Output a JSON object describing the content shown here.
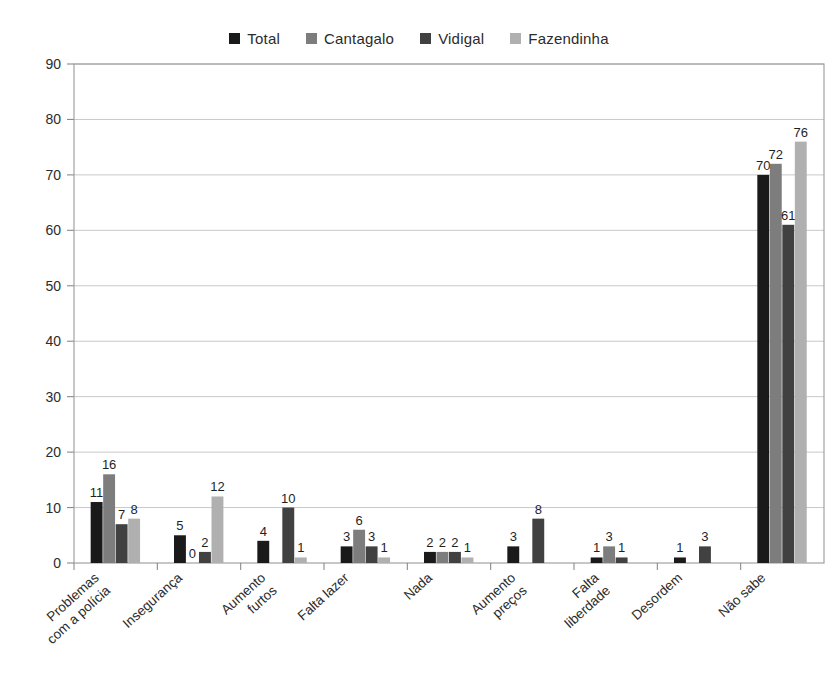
{
  "legend": {
    "position": "top-center",
    "items": [
      {
        "label": "Total",
        "color": "#1a1a1a"
      },
      {
        "label": "Cantagalo",
        "color": "#7d7d7d"
      },
      {
        "label": "Vidigal",
        "color": "#414141"
      },
      {
        "label": "Fazendinha",
        "color": "#b0b0b0"
      }
    ]
  },
  "chart_data": {
    "type": "bar",
    "title": "",
    "subtitle": "",
    "xlabel": "",
    "ylabel": "",
    "ylim": [
      0,
      90
    ],
    "ytick_step": 10,
    "yticks": [
      0,
      10,
      20,
      30,
      40,
      50,
      60,
      70,
      80,
      90
    ],
    "grid": true,
    "grid_axis": "y",
    "legend_position": "top-center",
    "data_labels": true,
    "categories": [
      "Problemas com a polícia",
      "Insegurança",
      "Aumento furtos",
      "Falta lazer",
      "Nada",
      "Aumento preços",
      "Falta liberdade",
      "Desordem",
      "Não sabe"
    ],
    "category_lines": [
      [
        "Problemas",
        "com a polícia"
      ],
      [
        "Insegurança"
      ],
      [
        "Aumento",
        "furtos"
      ],
      [
        "Falta lazer"
      ],
      [
        "Nada"
      ],
      [
        "Aumento",
        "preços"
      ],
      [
        "Falta",
        "liberdade"
      ],
      [
        "Desordem"
      ],
      [
        "Não sabe"
      ]
    ],
    "series": [
      {
        "name": "Total",
        "color": "#1a1a1a",
        "values": [
          11,
          5,
          4,
          3,
          2,
          3,
          1,
          1,
          70
        ]
      },
      {
        "name": "Cantagalo",
        "color": "#7d7d7d",
        "values": [
          16,
          0,
          0,
          6,
          2,
          0,
          3,
          0,
          72
        ]
      },
      {
        "name": "Vidigal",
        "color": "#414141",
        "values": [
          7,
          2,
          10,
          3,
          2,
          8,
          1,
          3,
          61
        ]
      },
      {
        "name": "Fazendinha",
        "color": "#b0b0b0",
        "values": [
          8,
          12,
          1,
          1,
          1,
          0,
          0,
          0,
          76
        ]
      }
    ],
    "value_labels": [
      {
        "category": "Problemas com a polícia",
        "series": "Total",
        "text": "11"
      },
      {
        "category": "Problemas com a polícia",
        "series": "Cantagalo",
        "text": "16"
      },
      {
        "category": "Problemas com a polícia",
        "series": "Vidigal",
        "text": "7"
      },
      {
        "category": "Problemas com a polícia",
        "series": "Fazendinha",
        "text": "8"
      },
      {
        "category": "Insegurança",
        "series": "Total",
        "text": "5"
      },
      {
        "category": "Insegurança",
        "series": "Cantagalo",
        "text": "0"
      },
      {
        "category": "Insegurança",
        "series": "Vidigal",
        "text": "2"
      },
      {
        "category": "Insegurança",
        "series": "Fazendinha",
        "text": "12"
      },
      {
        "category": "Aumento furtos",
        "series": "Total",
        "text": "4"
      },
      {
        "category": "Aumento furtos",
        "series": "Vidigal",
        "text": "10"
      },
      {
        "category": "Aumento furtos",
        "series": "Fazendinha",
        "text": "1"
      },
      {
        "category": "Falta lazer",
        "series": "Total",
        "text": "3"
      },
      {
        "category": "Falta lazer",
        "series": "Cantagalo",
        "text": "6"
      },
      {
        "category": "Falta lazer",
        "series": "Vidigal",
        "text": "3"
      },
      {
        "category": "Falta lazer",
        "series": "Fazendinha",
        "text": "1"
      },
      {
        "category": "Nada",
        "series": "Total",
        "text": "2"
      },
      {
        "category": "Nada",
        "series": "Cantagalo",
        "text": "2"
      },
      {
        "category": "Nada",
        "series": "Vidigal",
        "text": "2"
      },
      {
        "category": "Nada",
        "series": "Fazendinha",
        "text": "1"
      },
      {
        "category": "Aumento preços",
        "series": "Total",
        "text": "3"
      },
      {
        "category": "Aumento preços",
        "series": "Vidigal",
        "text": "8"
      },
      {
        "category": "Falta liberdade",
        "series": "Total",
        "text": "1"
      },
      {
        "category": "Falta liberdade",
        "series": "Cantagalo",
        "text": "3"
      },
      {
        "category": "Falta liberdade",
        "series": "Vidigal",
        "text": "1"
      },
      {
        "category": "Desordem",
        "series": "Total",
        "text": "1"
      },
      {
        "category": "Desordem",
        "series": "Vidigal",
        "text": "3"
      },
      {
        "category": "Não sabe",
        "series": "Total",
        "text": "70"
      },
      {
        "category": "Não sabe",
        "series": "Cantagalo",
        "text": "72"
      },
      {
        "category": "Não sabe",
        "series": "Vidigal",
        "text": "61"
      },
      {
        "category": "Não sabe",
        "series": "Fazendinha",
        "text": "76"
      }
    ]
  }
}
